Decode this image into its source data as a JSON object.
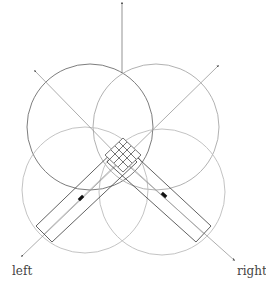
{
  "diagram": {
    "labels": {
      "left": "left",
      "right": "right"
    },
    "colors": {
      "background": "#ffffff",
      "circle_dark": "#6e6e6e",
      "circle_light": "#b4b4b4",
      "arm_stroke": "#3a3a3a",
      "axis": "#8a8a8a",
      "marker": "#111111",
      "text": "#444444"
    },
    "elements": {
      "circles": [
        {
          "name": "upper-left-lobe",
          "cx": 90,
          "cy": 127,
          "r": 63,
          "tone": "dark"
        },
        {
          "name": "upper-right-lobe",
          "cx": 156,
          "cy": 127,
          "r": 63,
          "tone": "light"
        },
        {
          "name": "lower-left-lobe",
          "cx": 85,
          "cy": 190,
          "r": 63,
          "tone": "light"
        },
        {
          "name": "lower-right-lobe",
          "cx": 162,
          "cy": 192,
          "r": 63,
          "tone": "light"
        }
      ],
      "axes": [
        {
          "name": "up-axis",
          "direction": "up"
        },
        {
          "name": "upper-left-axis",
          "direction": "upper-left"
        },
        {
          "name": "upper-right-axis",
          "direction": "upper-right"
        },
        {
          "name": "lower-left-axis",
          "direction": "lower-left"
        },
        {
          "name": "lower-right-axis",
          "direction": "lower-right"
        }
      ],
      "arms": [
        "left-arm",
        "right-arm"
      ]
    }
  }
}
